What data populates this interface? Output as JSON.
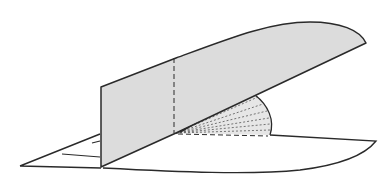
{
  "figure": {
    "colors": {
      "stroke": "#2a2a2a",
      "shade": "#dcdcdc",
      "fan_shade": "#e6e6e6",
      "background": "#ffffff"
    }
  }
}
